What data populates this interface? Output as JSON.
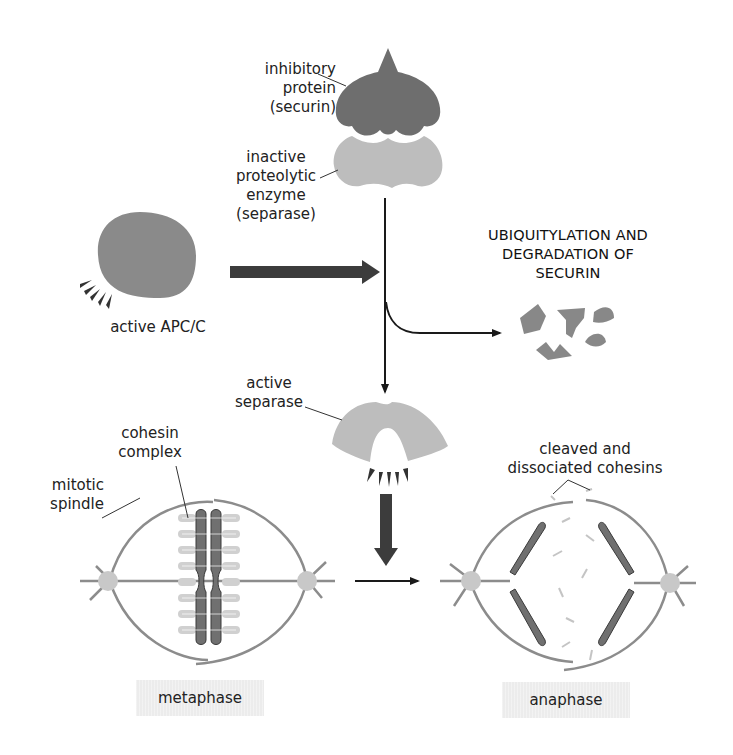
{
  "labels": {
    "securin": [
      "inhibitory",
      "protein",
      "(securin)"
    ],
    "inactive_separase": [
      "inactive",
      "proteolytic",
      "enzyme",
      "(separase)"
    ],
    "apc": "active APC/C",
    "degradation": [
      "UBIQUITYLATION AND",
      "DEGRADATION OF",
      "SECURIN"
    ],
    "active_separase": [
      "active",
      "separase"
    ],
    "cohesin": [
      "cohesin",
      "complex"
    ],
    "spindle": [
      "mitotic",
      "spindle"
    ],
    "cleaved": [
      "cleaved and",
      "dissociated cohesins"
    ]
  },
  "stages": {
    "left": "metaphase",
    "right": "anaphase"
  },
  "colors": {
    "securin": "#6e6e6e",
    "separase": "#bdbdbd",
    "apc": "#8a8a8a",
    "chromosome": "#707070",
    "spindle": "#8c8c8c",
    "pole": "#c8c8c8",
    "cohesin": "#d0d0d0",
    "arrow": "#1a1a1a",
    "thick_arrow": "#3c3c3c"
  }
}
